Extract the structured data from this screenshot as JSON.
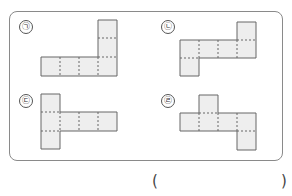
{
  "problem": {
    "options": [
      {
        "id": "a",
        "label": "㉠",
        "cells": [
          [
            98,
            20
          ],
          [
            98,
            38
          ],
          [
            41,
            57
          ],
          [
            60,
            57
          ],
          [
            79,
            57
          ],
          [
            98,
            57
          ]
        ]
      },
      {
        "id": "b",
        "label": "㉡",
        "cells": [
          [
            237,
            22
          ],
          [
            180,
            40
          ],
          [
            199,
            40
          ],
          [
            218,
            40
          ],
          [
            237,
            40
          ],
          [
            180,
            58
          ]
        ]
      },
      {
        "id": "c",
        "label": "㉢",
        "cells": [
          [
            41,
            94
          ],
          [
            41,
            112
          ],
          [
            60,
            112
          ],
          [
            79,
            112
          ],
          [
            98,
            112
          ],
          [
            41,
            131
          ]
        ]
      },
      {
        "id": "d",
        "label": "㉣",
        "cells": [
          [
            199,
            95
          ],
          [
            180,
            113
          ],
          [
            199,
            113
          ],
          [
            218,
            113
          ],
          [
            237,
            113
          ],
          [
            237,
            131
          ]
        ]
      }
    ],
    "answer_open": "(",
    "answer_close": ")",
    "answer_value": ""
  },
  "colors": {
    "fill": "#eeeeee",
    "stroke": "#666666"
  }
}
